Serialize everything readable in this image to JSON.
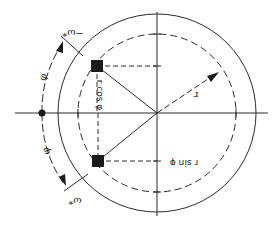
{
  "diagram": {
    "orientation": "rotated 180 degrees",
    "colors": {
      "line": "#2a2a2a",
      "background": "#ffffff",
      "fill": "#1a1a1a"
    },
    "labels": {
      "r": "r",
      "r_cos": "r cos φ",
      "r_sin": "r sin φ",
      "phi_upper": "φ",
      "phi_lower": "φ",
      "omega_upper": "−ω*",
      "omega_lower": "ω*"
    },
    "elements": {
      "outer_circle": "solid circle",
      "inner_circle": "dashed circle of radius r",
      "axes": "horizontal and vertical axes through center",
      "points": [
        "upper filled square",
        "lower filled square"
      ],
      "origin_dot": "filled dot on left axis"
    }
  }
}
